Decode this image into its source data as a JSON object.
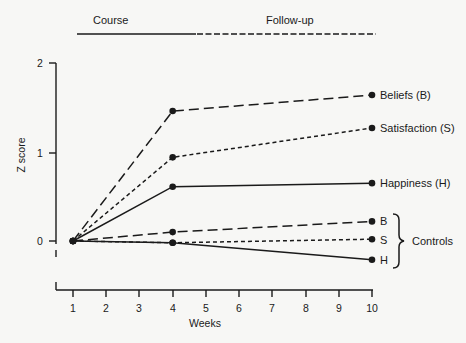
{
  "chart_data": {
    "type": "line",
    "title": "",
    "xlabel": "Weeks",
    "ylabel": "Z score",
    "x": [
      1,
      4,
      10
    ],
    "x_ticks": [
      1,
      2,
      3,
      4,
      5,
      6,
      7,
      8,
      9,
      10
    ],
    "y_ticks": [
      0,
      1,
      2
    ],
    "xlim": [
      1,
      10
    ],
    "ylim": [
      -0.4,
      2
    ],
    "grid": false,
    "phase_bar": {
      "course_label": "Course",
      "followup_label": "Follow-up",
      "course_range_weeks": [
        1,
        4
      ],
      "followup_range_weeks": [
        4,
        10
      ]
    },
    "series": [
      {
        "name": "Beliefs (B)",
        "label": "Beliefs (B)",
        "group": "treatment",
        "style": "long-dash",
        "values": [
          0,
          1.46,
          1.64
        ]
      },
      {
        "name": "Satisfaction (S)",
        "label": "Satisfaction (S)",
        "group": "treatment",
        "style": "short-dash",
        "values": [
          0,
          0.94,
          1.27
        ]
      },
      {
        "name": "Happiness (H)",
        "label": "Happiness (H)",
        "group": "treatment",
        "style": "solid",
        "values": [
          0,
          0.61,
          0.65
        ]
      },
      {
        "name": "Controls B",
        "label": "B",
        "group": "controls",
        "style": "long-dash",
        "values": [
          0,
          0.1,
          0.22
        ]
      },
      {
        "name": "Controls S",
        "label": "S",
        "group": "controls",
        "style": "short-dash",
        "values": [
          0,
          -0.02,
          0.02
        ]
      },
      {
        "name": "Controls H",
        "label": "H",
        "group": "controls",
        "style": "solid",
        "values": [
          0,
          -0.02,
          -0.21
        ]
      }
    ],
    "annotations": [
      {
        "text": "Controls",
        "target": "controls-group-brace"
      }
    ],
    "legend_position": "inline-right"
  },
  "labels": {
    "course": "Course",
    "followup": "Follow-up",
    "ylabel": "Z score",
    "xlabel": "Weeks",
    "controls": "Controls",
    "yticks": [
      "0",
      "1",
      "2"
    ],
    "xticks": [
      "1",
      "2",
      "3",
      "4",
      "5",
      "6",
      "7",
      "8",
      "9",
      "10"
    ],
    "series": [
      "Beliefs (B)",
      "Satisfaction (S)",
      "Happiness (H)",
      "B",
      "S",
      "H"
    ]
  },
  "colors": {
    "ink": "#1a1a1a",
    "background": "#f7f7f5"
  }
}
